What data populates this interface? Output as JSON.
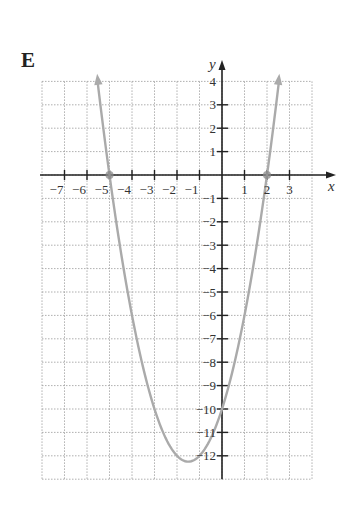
{
  "panel": {
    "label": "E"
  },
  "chart_data": {
    "type": "line",
    "title": "",
    "panel_label": "E",
    "xlabel": "x",
    "ylabel": "y",
    "xlim": [
      -8,
      4
    ],
    "ylim": [
      -13,
      4
    ],
    "grid": true,
    "x_ticks": [
      -7,
      -6,
      -5,
      -4,
      -3,
      -2,
      -1,
      1,
      2,
      3
    ],
    "y_ticks": [
      4,
      3,
      2,
      1,
      -1,
      -2,
      -3,
      -4,
      -5,
      -6,
      -7,
      -8,
      -9,
      -10,
      -11,
      -12
    ],
    "series": [
      {
        "name": "y = x^2 + 3x - 10",
        "function": "x^2+3x-10",
        "x_range": [
          -5.53,
          2.53
        ],
        "arrows_both_ends": true,
        "color": "#aaaaaa",
        "key_points": [
          {
            "x": -5,
            "y": 0
          },
          {
            "x": 2,
            "y": 0
          },
          {
            "x": 0,
            "y": -10
          },
          {
            "x": -1.5,
            "y": -12.25
          }
        ]
      }
    ],
    "marked_points": [
      {
        "x": -5,
        "y": 0
      },
      {
        "x": 2,
        "y": 0
      }
    ]
  }
}
